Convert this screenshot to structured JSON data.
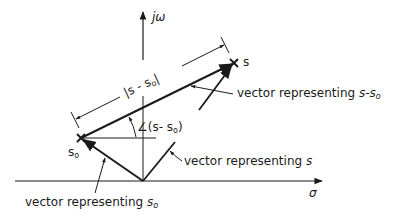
{
  "diagram": {
    "type": "s-plane vector diagram",
    "colors": {
      "ink": "#1a1a1a",
      "background": "#ffffff"
    },
    "axes": {
      "imag_label": "jω",
      "real_label": "σ"
    },
    "points": {
      "s": {
        "label": "s"
      },
      "s0": {
        "label": "s",
        "sub": "o"
      }
    },
    "labels": {
      "magnitude": {
        "prefix": "|s - s",
        "sub": "o",
        "suffix": "|"
      },
      "angle": {
        "prefix": "∠(s- s",
        "sub": "o",
        "suffix": ")"
      },
      "vec_diff": {
        "text": "vector representing ",
        "math": "s-s",
        "sub": "o"
      },
      "vec_s": {
        "text": "vector representing ",
        "math": "s"
      },
      "vec_s0": {
        "text": "vector representing ",
        "math": "s",
        "sub": "o"
      }
    }
  }
}
